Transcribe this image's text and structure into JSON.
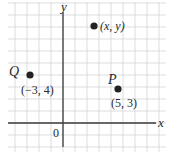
{
  "diagram": {
    "type": "coordinate-plane",
    "grid": {
      "spacing_px": 12,
      "color": "#d4d4d4",
      "x0": 8,
      "y0": 2,
      "x1": 166,
      "y1": 152
    },
    "axes": {
      "color": "#3a3a3a",
      "origin_px": {
        "x": 63,
        "y": 123
      },
      "x_axis": {
        "label": "x",
        "from_px": 8,
        "to_px": 156
      },
      "y_axis": {
        "label": "y",
        "from_px": 12,
        "to_px": 147
      },
      "origin_label": "0"
    },
    "points": [
      {
        "id": "Q",
        "name": "Q",
        "coords_label": "(−3, 4)",
        "px": {
          "x": 30,
          "y": 75
        },
        "name_pos": {
          "x": 9,
          "y": 76
        },
        "coords_pos": {
          "x": 21,
          "y": 94
        }
      },
      {
        "id": "xy",
        "name": "",
        "coords_label": "(x, y)",
        "px": {
          "x": 94,
          "y": 26
        },
        "name_pos": {
          "x": 0,
          "y": 0
        },
        "coords_pos": {
          "x": 100,
          "y": 30
        }
      },
      {
        "id": "P",
        "name": "P",
        "coords_label": "(5, 3)",
        "px": {
          "x": 118,
          "y": 89
        },
        "name_pos": {
          "x": 108,
          "y": 84
        },
        "coords_pos": {
          "x": 111,
          "y": 107
        }
      }
    ],
    "point_color": "#222222"
  }
}
